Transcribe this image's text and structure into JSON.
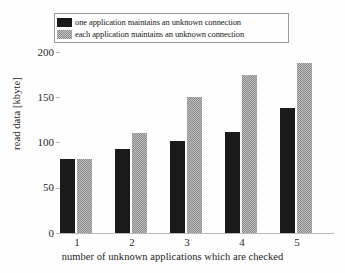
{
  "chart_data": {
    "type": "bar",
    "title": "",
    "xlabel": "number of unknown applications which are checked",
    "ylabel": "read data [kbyte]",
    "categories": [
      "1",
      "2",
      "3",
      "4",
      "5"
    ],
    "series": [
      {
        "name": "one application maintains an unknown connection",
        "color": "#1a1a1a",
        "values": [
          82,
          93,
          102,
          112,
          138
        ]
      },
      {
        "name": "each application maintains an unknown connection",
        "color": "#8d8d8d",
        "values": [
          82,
          111,
          151,
          175,
          188
        ]
      }
    ],
    "yticks": [
      0,
      50,
      100,
      150,
      200
    ],
    "ytick_labels": [
      "0",
      "50",
      "100",
      "150",
      "200"
    ],
    "ylim": [
      0,
      200
    ],
    "grid": false,
    "legend_position": "top"
  },
  "legend": {
    "entries": [
      {
        "label": "one application maintains an unknown connection",
        "swatch": "dark-swatch"
      },
      {
        "label": "each application maintains an unknown connection",
        "swatch": "gray-swatch"
      }
    ]
  }
}
